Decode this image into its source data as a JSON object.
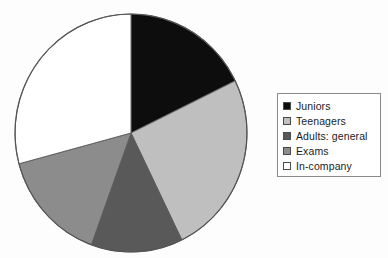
{
  "chart_data": {
    "type": "pie",
    "title": "",
    "subtitle": "",
    "xlabel": "",
    "ylabel": "",
    "grid": false,
    "legend_position": "right",
    "start_angle_deg": 0,
    "direction": "clockwise",
    "categories": [
      "Juniors",
      "Teenagers",
      "Adults: general",
      "Exams",
      "In-company"
    ],
    "values": [
      18,
      25,
      13,
      15,
      29
    ],
    "slice_angles_deg": [
      64,
      90,
      46,
      55,
      105
    ],
    "colors": [
      "#0d0d0d",
      "#bfbfbf",
      "#595959",
      "#8c8c8c",
      "#ffffff"
    ],
    "slices": [
      {
        "label": "Juniors",
        "value": 18,
        "angle_deg": 64,
        "start_deg": 0,
        "end_deg": 64,
        "color": "#0d0d0d"
      },
      {
        "label": "Teenagers",
        "value": 25,
        "angle_deg": 90,
        "start_deg": 64,
        "end_deg": 154,
        "color": "#bfbfbf"
      },
      {
        "label": "Adults: general",
        "value": 13,
        "angle_deg": 46,
        "start_deg": 154,
        "end_deg": 200,
        "color": "#595959"
      },
      {
        "label": "Exams",
        "value": 15,
        "angle_deg": 55,
        "start_deg": 200,
        "end_deg": 255,
        "color": "#8c8c8c"
      },
      {
        "label": "In-company",
        "value": 29,
        "angle_deg": 105,
        "start_deg": 255,
        "end_deg": 360,
        "color": "#ffffff"
      }
    ]
  },
  "legend": {
    "items": [
      {
        "label": "Juniors",
        "color": "#0d0d0d"
      },
      {
        "label": "Teenagers",
        "color": "#bfbfbf"
      },
      {
        "label": "Adults: general",
        "color": "#595959"
      },
      {
        "label": "Exams",
        "color": "#8c8c8c"
      },
      {
        "label": "In-company",
        "color": "#ffffff"
      }
    ]
  },
  "page": {
    "background": "#fdfdfd",
    "outline_color": "#555555"
  }
}
